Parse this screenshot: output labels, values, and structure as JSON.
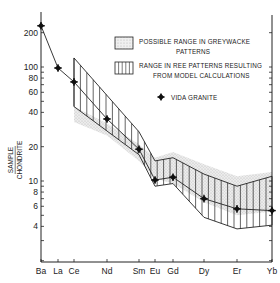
{
  "chart_data": {
    "type": "line",
    "title": "",
    "xlabel": "",
    "ylabel": "SAMPLE / CHONDRITE",
    "yscale": "log",
    "ylim": [
      2,
      300
    ],
    "grid": false,
    "legend_position": "upper right (inside)",
    "categories": [
      "Ba",
      "La",
      "Ce",
      "Nd",
      "Sm",
      "Eu",
      "Gd",
      "Dy",
      "Er",
      "Yb"
    ],
    "y_ticks": [
      200,
      100,
      80,
      60,
      40,
      20,
      10,
      8,
      6,
      4
    ],
    "series": [
      {
        "name": "VIDA GRANITE",
        "marker": "diamond-cross",
        "values": [
          230,
          98,
          74,
          35,
          19,
          10.2,
          10.8,
          7,
          5.7,
          5.5
        ]
      }
    ],
    "bands": [
      {
        "name": "RANGE IN REE PATTERNS RESULTING FROM MODEL CALCULATIONS",
        "pattern": "vertical-hatch",
        "categories": [
          "Ce",
          "Sm",
          "Eu",
          "Gd",
          "Dy",
          "Er",
          "Yb"
        ],
        "upper": [
          120,
          27,
          15,
          16,
          11.5,
          9,
          11
        ],
        "lower": [
          45,
          17,
          9,
          9.5,
          4.8,
          3.8,
          4.1
        ]
      },
      {
        "name": "POSSIBLE RANGE IN GREYWACKE PATTERNS",
        "pattern": "stipple",
        "categories": [
          "Ce",
          "Nd",
          "Sm",
          "Eu",
          "Gd",
          "Dy",
          "Er",
          "Yb"
        ],
        "upper": [
          45,
          32,
          21,
          16,
          18,
          14,
          11,
          12
        ],
        "lower": [
          33,
          25,
          15,
          10.5,
          9.5,
          6.5,
          5,
          5.4
        ]
      }
    ]
  },
  "legend": {
    "greywacke_line1": "POSSIBLE RANGE IN GREYWACKE",
    "greywacke_line2": "PATTERNS",
    "model_line1": "RANGE IN REE PATTERNS RESULTING",
    "model_line2": "FROM MODEL CALCULATIONS",
    "granite": "VIDA GRANITE"
  },
  "axis": {
    "ylabel_top": "SAMPLE",
    "ylabel_bottom": "CHONDRITE"
  },
  "colors": {
    "ink": "#222222",
    "stipple": "#c8c8c8",
    "background": "#ffffff"
  }
}
